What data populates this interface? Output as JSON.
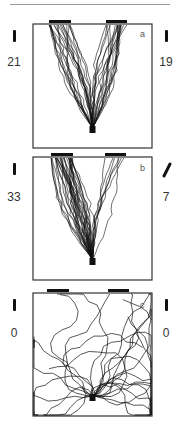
{
  "figure": {
    "panels": [
      {
        "label": "a",
        "left_count": "21",
        "right_count": "19",
        "left_cue": "vertical-bar",
        "right_cue": "vertical-bar",
        "box": {
          "x": 33,
          "y": 24,
          "w": 119,
          "h": 124
        },
        "doors": [
          {
            "x": 49,
            "w": 22
          },
          {
            "x": 106,
            "w": 21
          }
        ],
        "pattern": "symmetric-v"
      },
      {
        "label": "b",
        "left_count": "33",
        "right_count": "7",
        "left_cue": "vertical-bar",
        "right_cue": "oblique-bar",
        "box": {
          "x": 33,
          "y": 157,
          "w": 119,
          "h": 123
        },
        "doors": [
          {
            "x": 51,
            "w": 22
          },
          {
            "x": 105,
            "w": 21
          }
        ],
        "pattern": "left-biased-v"
      },
      {
        "label": "c",
        "left_count": "0",
        "right_count": "0",
        "left_cue": "vertical-bar",
        "right_cue": "vertical-bar",
        "box": {
          "x": 33,
          "y": 293,
          "w": 119,
          "h": 123
        },
        "doors": [
          {
            "x": 47,
            "w": 22
          },
          {
            "x": 108,
            "w": 21
          }
        ],
        "pattern": "random-walk"
      }
    ]
  },
  "colors": {
    "line": "#111111",
    "rule": "#9a9a9a",
    "text": "#333333"
  }
}
